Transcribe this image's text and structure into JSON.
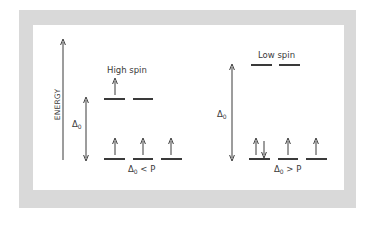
{
  "diagram": {
    "type": "crystal-field-splitting",
    "axis_label": "ENERGY",
    "delta_symbol": "Δ",
    "delta_subscript": "0",
    "colors": {
      "frame": "#d9d9d9",
      "background": "#ffffff",
      "ink": "#3a3a3a"
    },
    "panels": [
      {
        "title": "High spin",
        "condition": {
          "delta": "Δ",
          "sub": "0",
          "relation": "<",
          "rhs": "P"
        },
        "upper_orbitals": [
          {
            "electrons": [
              "up"
            ]
          },
          {
            "electrons": []
          }
        ],
        "lower_orbitals": [
          {
            "electrons": [
              "up"
            ]
          },
          {
            "electrons": [
              "up"
            ]
          },
          {
            "electrons": [
              "up"
            ]
          }
        ]
      },
      {
        "title": "Low spin",
        "condition": {
          "delta": "Δ",
          "sub": "0",
          "relation": ">",
          "rhs": "P"
        },
        "upper_orbitals": [
          {
            "electrons": []
          },
          {
            "electrons": []
          }
        ],
        "lower_orbitals": [
          {
            "electrons": [
              "up",
              "down"
            ]
          },
          {
            "electrons": [
              "up"
            ]
          },
          {
            "electrons": [
              "up"
            ]
          }
        ]
      }
    ]
  }
}
